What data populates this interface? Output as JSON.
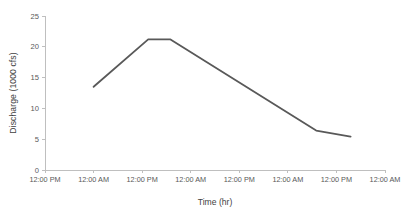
{
  "window": {
    "width": 410,
    "height": 215,
    "background": "#ffffff"
  },
  "chart_data": {
    "type": "line",
    "title": "",
    "xlabel": "Time (hr)",
    "ylabel": "Discharge (1000 cfs)",
    "x_tick_labels": [
      "12:00 PM",
      "12:00 AM",
      "12:00 PM",
      "12:00 AM",
      "12:00 PM",
      "12:00 AM",
      "12:00 PM",
      "12:00 AM"
    ],
    "x_tick_hours": [
      0,
      12,
      24,
      36,
      48,
      60,
      72,
      84
    ],
    "xlim_hours": [
      0,
      84
    ],
    "y_ticks": [
      0,
      5,
      10,
      15,
      20,
      25
    ],
    "ylim": [
      0,
      25
    ],
    "grid": "off",
    "legend": "none",
    "colors": {
      "axis_line": "#bfbfbf",
      "tick_label": "#595959",
      "axis_title": "#3f3f3f",
      "series_line": "#595959"
    },
    "series": [
      {
        "name": "Discharge",
        "points": [
          {
            "hour": 12,
            "value": 13.5
          },
          {
            "hour": 25.5,
            "value": 21.2
          },
          {
            "hour": 31,
            "value": 21.2
          },
          {
            "hour": 67,
            "value": 6.4
          },
          {
            "hour": 75.5,
            "value": 5.4
          }
        ]
      }
    ]
  }
}
